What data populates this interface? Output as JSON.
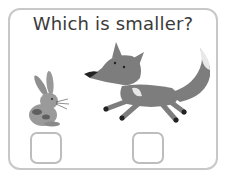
{
  "question": "Which is smaller?",
  "options": [
    {
      "animal": "rabbit",
      "checked": false
    },
    {
      "animal": "fox",
      "checked": false
    }
  ]
}
